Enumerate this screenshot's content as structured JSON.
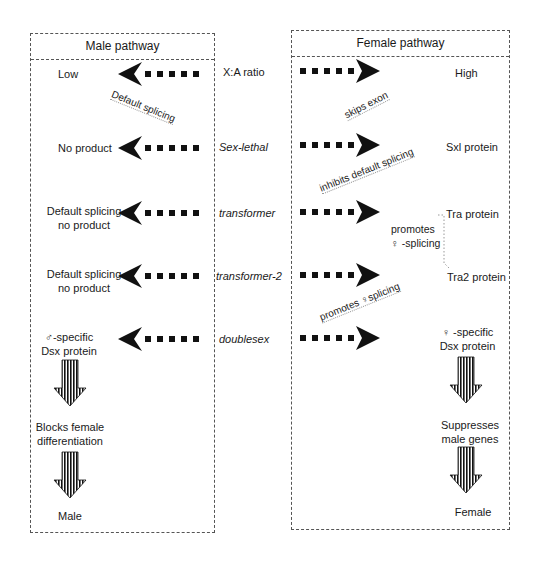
{
  "male_pathway": {
    "title": "Male pathway",
    "stages": [
      {
        "label": "Low"
      },
      {
        "label": "No product"
      },
      {
        "label": "Default splicing\nno product"
      },
      {
        "label": "Default splicing\nno product"
      },
      {
        "label": "♂-specific\nDsx protein"
      }
    ],
    "annotation": "Default splicing",
    "outcome_1": "Blocks female\ndifferentiation",
    "outcome_2": "Male"
  },
  "genes": [
    {
      "label": "X:A ratio",
      "italic": false
    },
    {
      "label": "Sex-lethal",
      "italic": true
    },
    {
      "label": "transformer",
      "italic": true
    },
    {
      "label": "transformer-2",
      "italic": true
    },
    {
      "label": "doublesex",
      "italic": true
    }
  ],
  "female_pathway": {
    "title": "Female pathway",
    "stages": [
      {
        "label": "High"
      },
      {
        "label": "Sxl protein"
      },
      {
        "label": "Tra protein"
      },
      {
        "label": "Tra2 protein"
      },
      {
        "label": "♀ -specific\nDsx protein"
      }
    ],
    "annotations": {
      "skips_exon": "skips exon",
      "inhibits": "inhibits default splicing",
      "promotes_tra": "promotes\n♀ -splicing",
      "promotes_tra2": "promotes  ♀splicing"
    },
    "outcome_1": "Suppresses\nmale genes",
    "outcome_2": "Female"
  }
}
